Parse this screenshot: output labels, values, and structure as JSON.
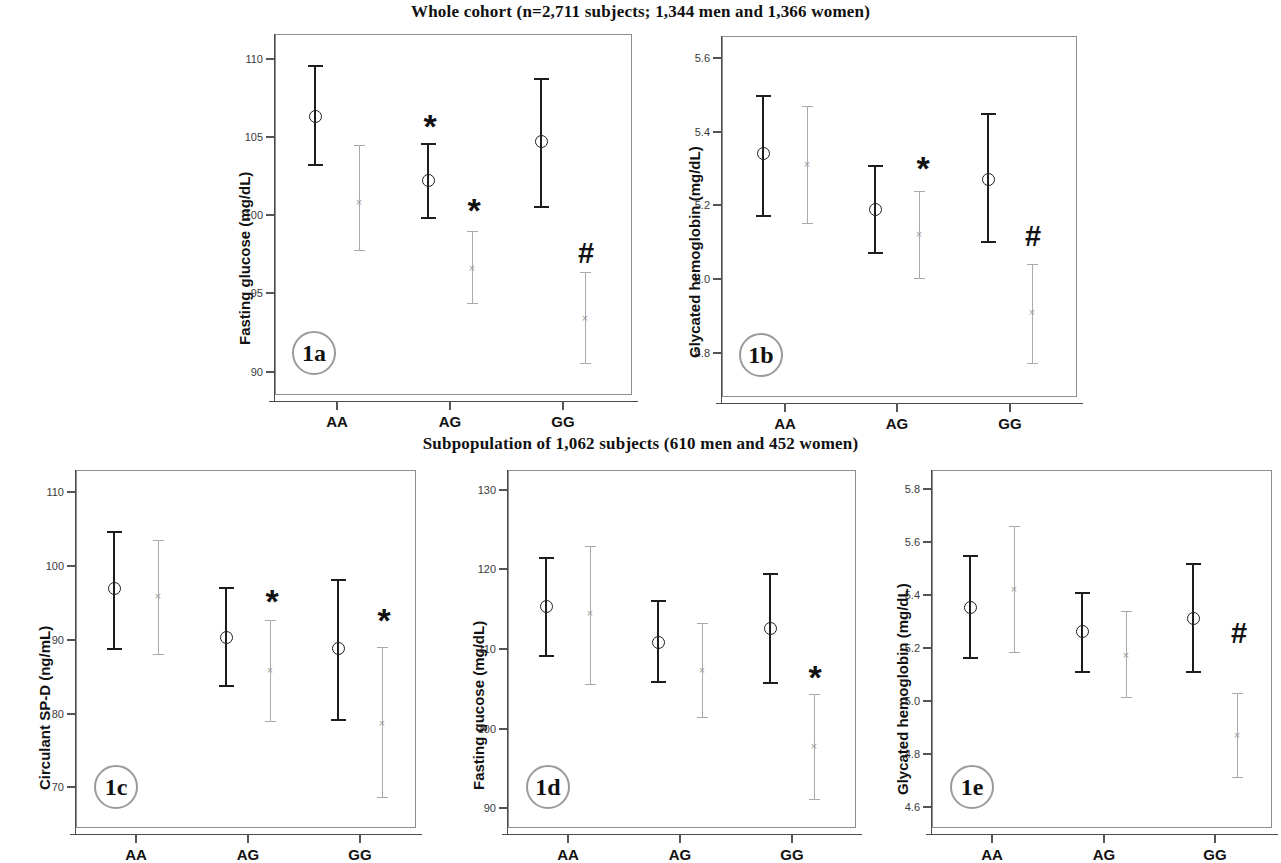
{
  "figure": {
    "row_titles": {
      "row1": "Whole cohort (n=2,711 subjects; 1,344 men and 1,366 women)",
      "row2": "Subpopulation of 1,062 subjects (610 men and 452 women)"
    },
    "significance_symbols": {
      "star": "*",
      "hash": "#"
    },
    "series_names": {
      "men": "Men",
      "women": "Women"
    },
    "colors": {
      "men": "#1d1d1d",
      "women": "#a9a9a9",
      "frame": "#8d8d8d",
      "text": "#111111"
    }
  },
  "chart_data": [
    {
      "id": "1a",
      "type": "scatter",
      "badge": "1a",
      "title": "Whole cohort (n=2,711 subjects; 1,344 men and 1,366 women)",
      "ylabel": "Fasting glucose (mg/dL)",
      "xlabel": "",
      "categories": [
        "AA",
        "AG",
        "GG"
      ],
      "ylim": [
        88.5,
        111.6
      ],
      "yticks": [
        90,
        95,
        100,
        105,
        110
      ],
      "ytick_labels": [
        "90",
        "95",
        "100",
        "105",
        "110"
      ],
      "grid": false,
      "legend": "none",
      "series": [
        {
          "name": "Men",
          "marker": "circle",
          "color": "#1d1d1d",
          "values": [
            106.3,
            102.2,
            104.7
          ],
          "ci_low": [
            103.2,
            99.8,
            100.5
          ],
          "ci_high": [
            109.6,
            104.6,
            108.8
          ],
          "annotations": [
            "",
            "*",
            ""
          ]
        },
        {
          "name": "Women",
          "marker": "x",
          "color": "#a9a9a9",
          "values": [
            100.8,
            96.6,
            93.4
          ],
          "ci_low": [
            97.7,
            94.3,
            90.5
          ],
          "ci_high": [
            104.5,
            99.0,
            96.4
          ],
          "annotations": [
            "",
            "*",
            "#"
          ]
        }
      ]
    },
    {
      "id": "1b",
      "type": "scatter",
      "badge": "1b",
      "title": "Whole cohort (n=2,711 subjects; 1,344 men and 1,366 women)",
      "ylabel": "Glycated hemoglobin (mg/dL)",
      "xlabel": "",
      "categories": [
        "AA",
        "AG",
        "GG"
      ],
      "ylim": [
        4.68,
        5.66
      ],
      "yticks": [
        4.8,
        5.0,
        5.2,
        5.4,
        5.6
      ],
      "ytick_labels": [
        "4.8",
        "5.0",
        "5.2",
        "5.4",
        "5.6"
      ],
      "grid": false,
      "legend": "none",
      "series": [
        {
          "name": "Men",
          "marker": "circle",
          "color": "#1d1d1d",
          "values": [
            5.34,
            5.19,
            5.27
          ],
          "ci_low": [
            5.17,
            5.07,
            5.1
          ],
          "ci_high": [
            5.5,
            5.31,
            5.45
          ],
          "annotations": [
            "",
            "",
            ""
          ]
        },
        {
          "name": "Women",
          "marker": "x",
          "color": "#a9a9a9",
          "values": [
            5.31,
            5.12,
            4.91
          ],
          "ci_low": [
            5.15,
            5.0,
            4.77
          ],
          "ci_high": [
            5.47,
            5.24,
            5.04
          ],
          "annotations": [
            "",
            "*",
            "#"
          ]
        }
      ]
    },
    {
      "id": "1c",
      "type": "scatter",
      "badge": "1c",
      "title": "Subpopulation of 1,062 subjects (610 men and 452 women)",
      "ylabel": "Circulant SP-D (ng/mL)",
      "xlabel": "",
      "categories": [
        "AA",
        "AG",
        "GG"
      ],
      "ylim": [
        64.5,
        113.0
      ],
      "yticks": [
        70,
        80,
        90,
        100,
        110
      ],
      "ytick_labels": [
        "70",
        "80",
        "90",
        "100",
        "110"
      ],
      "grid": false,
      "legend": "none",
      "series": [
        {
          "name": "Men",
          "marker": "circle",
          "color": "#1d1d1d",
          "values": [
            96.9,
            90.3,
            88.8
          ],
          "ci_low": [
            88.7,
            83.7,
            79.1
          ],
          "ci_high": [
            104.7,
            97.1,
            98.3
          ],
          "annotations": [
            "",
            "",
            ""
          ]
        },
        {
          "name": "Women",
          "marker": "x",
          "color": "#a9a9a9",
          "values": [
            95.8,
            85.8,
            78.7
          ],
          "ci_low": [
            87.9,
            78.9,
            68.5
          ],
          "ci_high": [
            103.5,
            92.7,
            89.0
          ],
          "annotations": [
            "",
            "*",
            "*"
          ]
        }
      ]
    },
    {
      "id": "1d",
      "type": "scatter",
      "badge": "1d",
      "title": "Subpopulation of 1,062 subjects (610 men and 452 women)",
      "ylabel": "Fasting gucose (mg/dL)",
      "xlabel": "",
      "categories": [
        "AA",
        "AG",
        "GG"
      ],
      "ylim": [
        87.5,
        132.5
      ],
      "yticks": [
        90,
        100,
        110,
        120,
        130
      ],
      "ytick_labels": [
        "90",
        "100",
        "110",
        "120",
        "130"
      ],
      "grid": false,
      "legend": "none",
      "series": [
        {
          "name": "Men",
          "marker": "circle",
          "color": "#1d1d1d",
          "values": [
            115.3,
            110.8,
            112.6
          ],
          "ci_low": [
            109.1,
            105.8,
            105.7
          ],
          "ci_high": [
            121.6,
            116.1,
            119.6
          ],
          "annotations": [
            "",
            "",
            ""
          ]
        },
        {
          "name": "Women",
          "marker": "x",
          "color": "#a9a9a9",
          "values": [
            114.4,
            107.3,
            97.8
          ],
          "ci_low": [
            105.5,
            101.3,
            91.0
          ],
          "ci_high": [
            122.9,
            113.3,
            104.4
          ],
          "annotations": [
            "",
            "",
            "*"
          ]
        }
      ]
    },
    {
      "id": "1e",
      "type": "scatter",
      "badge": "1e",
      "title": "Subpopulation of 1,062 subjects (610 men and 452 women)",
      "ylabel": "Glycated hemoglobin (mg/dL)",
      "xlabel": "",
      "categories": [
        "AA",
        "AG",
        "GG"
      ],
      "ylim": [
        4.52,
        5.87
      ],
      "yticks": [
        4.6,
        4.8,
        5.0,
        5.2,
        5.4,
        5.6,
        5.8
      ],
      "ytick_labels": [
        "4.6",
        "4.8",
        "5.0",
        "5.2",
        "5.4",
        "5.6",
        "5.8"
      ],
      "grid": false,
      "legend": "none",
      "series": [
        {
          "name": "Men",
          "marker": "circle",
          "color": "#1d1d1d",
          "values": [
            5.35,
            5.26,
            5.31
          ],
          "ci_low": [
            5.16,
            5.11,
            5.11
          ],
          "ci_high": [
            5.55,
            5.41,
            5.52
          ],
          "annotations": [
            "",
            "",
            ""
          ]
        },
        {
          "name": "Women",
          "marker": "x",
          "color": "#a9a9a9",
          "values": [
            5.42,
            5.17,
            4.87
          ],
          "ci_low": [
            5.18,
            5.01,
            4.71
          ],
          "ci_high": [
            5.66,
            5.34,
            5.03
          ],
          "annotations": [
            "",
            "",
            "#"
          ]
        }
      ]
    }
  ],
  "panel_layout": [
    {
      "id": "1a",
      "frame": {
        "x": 275,
        "y": 34,
        "w": 357,
        "h": 361
      },
      "ytitle_x": 236,
      "ytitle_y": 345,
      "group_x": [
        337,
        450,
        563
      ],
      "offset": 22,
      "badge": {
        "x": 292,
        "y": 331
      },
      "sig": [
        {
          "sym": "*",
          "x": 430,
          "y": 126
        },
        {
          "sym": "*",
          "x": 474,
          "y": 210
        },
        {
          "sym": "#",
          "x": 586,
          "y": 253
        }
      ]
    },
    {
      "id": "1b",
      "frame": {
        "x": 722,
        "y": 36,
        "w": 355,
        "h": 361
      },
      "ytitle_x": 686,
      "ytitle_y": 358,
      "group_x": [
        785,
        897,
        1010
      ],
      "offset": 22,
      "badge": {
        "x": 739,
        "y": 333
      },
      "sig": [
        {
          "sym": "*",
          "x": 923,
          "y": 168
        },
        {
          "sym": "#",
          "x": 1033,
          "y": 236
        }
      ]
    },
    {
      "id": "1c",
      "frame": {
        "x": 76,
        "y": 470,
        "w": 340,
        "h": 358
      },
      "ytitle_x": 36,
      "ytitle_y": 790,
      "group_x": [
        136,
        248,
        360
      ],
      "offset": 22,
      "badge": {
        "x": 94,
        "y": 765
      },
      "sig": [
        {
          "sym": "*",
          "x": 272,
          "y": 601
        },
        {
          "sym": "*",
          "x": 384,
          "y": 620
        }
      ]
    },
    {
      "id": "1d",
      "frame": {
        "x": 508,
        "y": 470,
        "w": 348,
        "h": 358
      },
      "ytitle_x": 470,
      "ytitle_y": 790,
      "group_x": [
        568,
        680,
        792
      ],
      "offset": 22,
      "badge": {
        "x": 526,
        "y": 765
      },
      "sig": [
        {
          "sym": "*",
          "x": 815,
          "y": 677
        }
      ]
    },
    {
      "id": "1e",
      "frame": {
        "x": 932,
        "y": 470,
        "w": 340,
        "h": 358
      },
      "ytitle_x": 894,
      "ytitle_y": 795,
      "group_x": [
        992,
        1104,
        1215
      ],
      "offset": 22,
      "badge": {
        "x": 950,
        "y": 765
      },
      "sig": [
        {
          "sym": "#",
          "x": 1239,
          "y": 633
        }
      ]
    }
  ]
}
